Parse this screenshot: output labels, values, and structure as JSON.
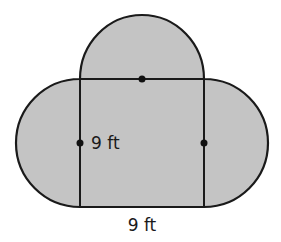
{
  "diagram": {
    "colors": {
      "fill": "#c4c4c4",
      "stroke": "#1a1a1a",
      "background": "#ffffff"
    },
    "square": {
      "side_label": "9 ft"
    },
    "labels": {
      "left_side": "9 ft",
      "bottom_side": "9 ft"
    },
    "semicircles": [
      {
        "position": "top",
        "center_marked": true
      },
      {
        "position": "left",
        "center_marked": true
      },
      {
        "position": "right",
        "center_marked": true
      }
    ]
  }
}
